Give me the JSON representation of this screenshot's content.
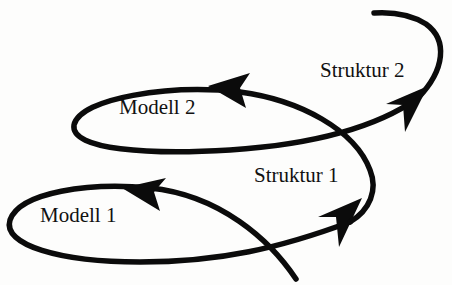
{
  "diagram": {
    "type": "spiral-cycle",
    "colors": {
      "stroke": "#0b0b0b",
      "text": "#111111",
      "background": "#fdfdfc"
    },
    "labels": {
      "modell1": "Modell 1",
      "struktur1": "Struktur 1",
      "modell2": "Modell 2",
      "struktur2": "Struktur 2"
    },
    "sequence": [
      "Modell 1",
      "Struktur 1",
      "Modell 2",
      "Struktur 2"
    ]
  }
}
